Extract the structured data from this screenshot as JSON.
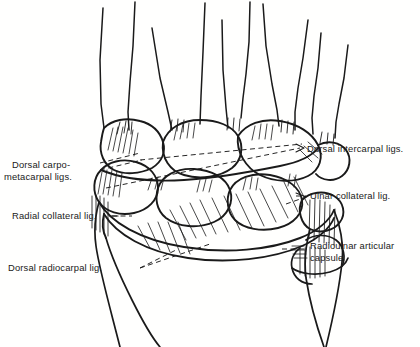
{
  "figure": {
    "view": "dorsal view of right carpus",
    "background_color": "#fffffe",
    "ink_color": "#1a1a1a"
  },
  "labels": [
    {
      "id": "dorsal-carpometacarpal",
      "lines": [
        "Dorsal carpo-",
        "metacarpal ligs."
      ],
      "align": "left",
      "x": 12,
      "y": 168
    },
    {
      "id": "radial-collateral",
      "lines": [
        "Radial collateral lig."
      ],
      "align": "left",
      "x": 12,
      "y": 219
    },
    {
      "id": "dorsal-radiocarpal",
      "lines": [
        "Dorsal radiocarpal lig."
      ],
      "align": "left",
      "x": 8,
      "y": 271
    },
    {
      "id": "dorsal-intercarpal",
      "lines": [
        "Dorsal intercarpal ligs."
      ],
      "align": "left",
      "x": 307,
      "y": 152
    },
    {
      "id": "ulnar-collateral",
      "lines": [
        "Ulnar collateral lig."
      ],
      "align": "left",
      "x": 310,
      "y": 199
    },
    {
      "id": "radioulnar-capsule",
      "lines": [
        "Radioulnar articular",
        "capsule"
      ],
      "align": "left",
      "x": 310,
      "y": 249
    }
  ],
  "structures": {
    "metacarpals": "five metacarpal shafts rising from carpal row",
    "distal_carpal_row": "trapezium, trapezoid, capitate, hamate",
    "proximal_carpal_row": "scaphoid, lunate, triquetrum, pisiform",
    "radius": "distal radius shaft, radial side",
    "ulna": "distal ulna with styloid process, ulnar side"
  }
}
